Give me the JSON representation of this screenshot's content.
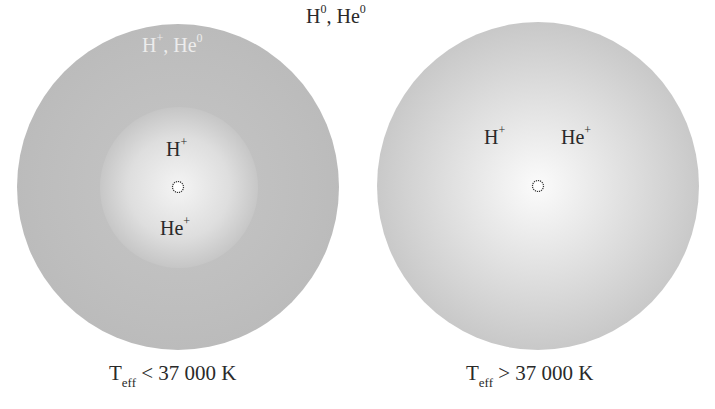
{
  "diagram": {
    "top_label": {
      "base1": "H",
      "sup1": "0",
      "sep": ", ",
      "base2": "He",
      "sup2": "0"
    },
    "left": {
      "outer_label": {
        "base1": "H",
        "sup1": "+",
        "sep": ", ",
        "base2": "He",
        "sup2": "0"
      },
      "inner_label_top": {
        "base": "H",
        "sup": "+"
      },
      "inner_label_bottom": {
        "base": "He",
        "sup": "+"
      },
      "caption": {
        "base": "T",
        "sub": "eff",
        "rest": " < 37 000 K"
      }
    },
    "right": {
      "label_h": {
        "base": "H",
        "sup": "+"
      },
      "label_he": {
        "base": "He",
        "sup": "+"
      },
      "caption": {
        "base": "T",
        "sub": "eff",
        "rest": " > 37 000 K"
      }
    },
    "icons": {
      "star": "star-icon"
    },
    "colors": {
      "outer_gray": "#bdbdbd",
      "center_light": "#f4f4f4",
      "text": "#2a2a2a",
      "light_text": "#ececec"
    }
  }
}
